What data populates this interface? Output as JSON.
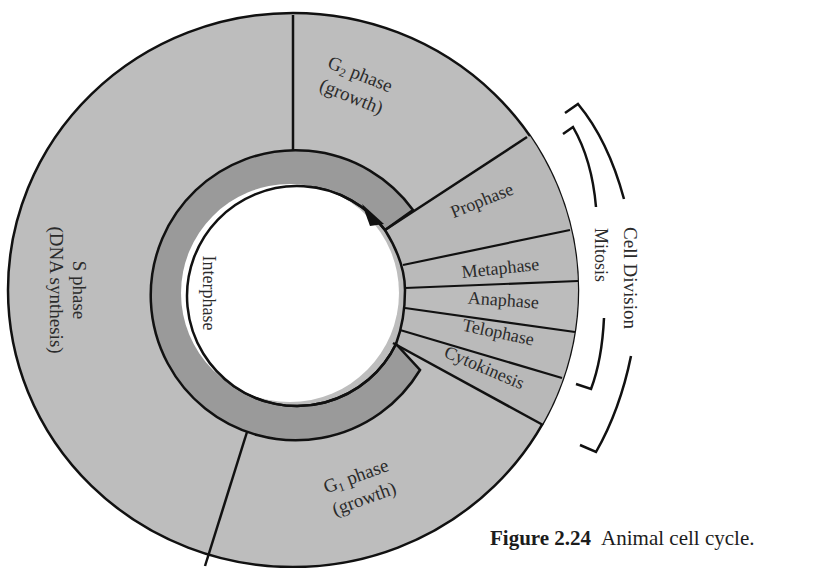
{
  "figure": {
    "number": "Figure 2.24",
    "caption": "Animal cell cycle."
  },
  "colors": {
    "phase_fill": "#bdbdbd",
    "ring_fill": "#9a9a9a",
    "stroke": "#111111",
    "text": "#2b2b2b"
  },
  "interphase": {
    "label": "Interphase",
    "phases": [
      {
        "id": "g2",
        "name_main": "G",
        "subscript": "2",
        "name_rest": " phase",
        "detail": "(growth)"
      },
      {
        "id": "s",
        "name": "S phase",
        "detail": "(DNA synthesis)"
      },
      {
        "id": "g1",
        "name_main": "G",
        "subscript": "1",
        "name_rest": " phase",
        "detail": "(growth)"
      }
    ]
  },
  "mitosis": {
    "label": "Mitosis",
    "stages": [
      {
        "id": "prophase",
        "name": "Prophase"
      },
      {
        "id": "metaphase",
        "name": "Metaphase"
      },
      {
        "id": "anaphase",
        "name": "Anaphase"
      },
      {
        "id": "telophase",
        "name": "Telophase"
      }
    ]
  },
  "cytokinesis": {
    "name": "Cytokinesis"
  },
  "cell_division": {
    "label": "Cell Division"
  },
  "arrow": {
    "direction": "clockwise"
  }
}
